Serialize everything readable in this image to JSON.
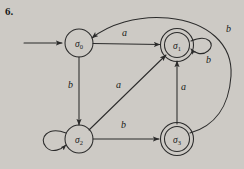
{
  "figure": {
    "number": "6.",
    "type": "finite-state-automaton-diagram",
    "background_color": "#cdcac5",
    "ink_color": "#2b2b2b"
  },
  "states": [
    {
      "id": "s0",
      "label": "σ",
      "subscript": "0",
      "accepting": false,
      "start": true,
      "cx": 79,
      "cy": 43
    },
    {
      "id": "s1",
      "label": "σ",
      "subscript": "1",
      "accepting": true,
      "start": false,
      "cx": 177,
      "cy": 45
    },
    {
      "id": "s2",
      "label": "σ",
      "subscript": "2",
      "accepting": false,
      "start": false,
      "cx": 79,
      "cy": 139
    },
    {
      "id": "s3",
      "label": "σ",
      "subscript": "3",
      "accepting": true,
      "start": false,
      "cx": 177,
      "cy": 139
    }
  ],
  "transitions": [
    {
      "id": "t-start",
      "from": "",
      "to": "s0",
      "label": "",
      "kind": "start-arrow"
    },
    {
      "id": "t-s0-s1",
      "from": "s0",
      "to": "s1",
      "label": "a",
      "kind": "straight-horizontal",
      "label_x": 122,
      "label_y": 33
    },
    {
      "id": "t-s0-s2",
      "from": "s0",
      "to": "s2",
      "label": "b",
      "kind": "straight-vertical",
      "label_x": 70,
      "label_y": 85
    },
    {
      "id": "t-s2-s1",
      "from": "s2",
      "to": "s1",
      "label": "a",
      "kind": "diagonal",
      "label_x": 117,
      "label_y": 85
    },
    {
      "id": "t-s2-s3",
      "from": "s2",
      "to": "s3",
      "label": "b",
      "kind": "straight-horizontal",
      "label_x": 122,
      "label_y": 126
    },
    {
      "id": "t-s3-s1",
      "from": "s3",
      "to": "s1",
      "label": "a",
      "kind": "straight-vertical",
      "label_x": 182,
      "label_y": 87
    },
    {
      "id": "t-s1-s1",
      "from": "s1",
      "to": "s1",
      "label": "b",
      "kind": "self-loop-right",
      "label_x": 209,
      "label_y": 59
    },
    {
      "id": "t-s3-s0",
      "from": "s3",
      "to": "s0",
      "label": "b",
      "kind": "long-arc",
      "label_x": 228,
      "label_y": 29
    },
    {
      "id": "t-s2-s2",
      "from": "s2",
      "to": "s2",
      "label": "",
      "kind": "self-loop-left"
    }
  ],
  "icons": {
    "start_arrow": "arrow-right-icon",
    "self_loop": "loop-icon"
  }
}
